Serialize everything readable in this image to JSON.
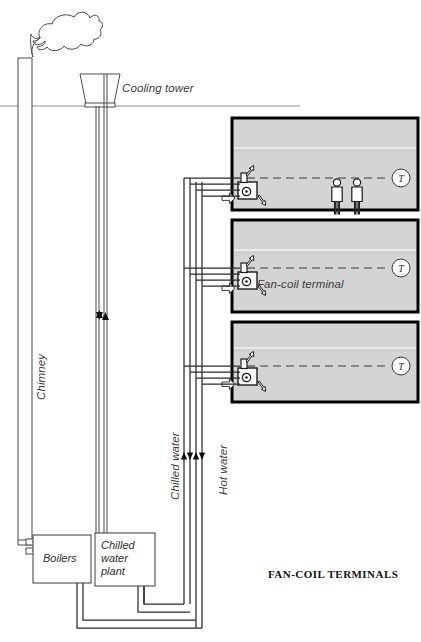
{
  "figure": {
    "title": "FAN-COIL TERMINALS",
    "title_pos": {
      "x": 268,
      "y": 568
    }
  },
  "labels": {
    "cooling_tower": "Cooling tower",
    "chimney": "Chimney",
    "chilled_water": "Chilled water",
    "hot_water": "Hot water",
    "fan_coil_terminal": "Fan-coil terminal",
    "boilers": "Boilers",
    "chilled_water_plant_line1": "Chilled",
    "chilled_water_plant_line2": "water",
    "chilled_water_plant_line3": "plant"
  },
  "thermostat": {
    "glyph": "T",
    "count": 3
  },
  "rooms": [
    {
      "index": 1,
      "x": 232,
      "y": 118,
      "w": 186,
      "h": 92,
      "occupants": 2,
      "thermostat_cx": 401,
      "thermostat_cy": 178
    },
    {
      "index": 2,
      "x": 232,
      "y": 220,
      "w": 186,
      "h": 92,
      "occupants": 0,
      "thermostat_cx": 401,
      "thermostat_cy": 268
    },
    {
      "index": 3,
      "x": 232,
      "y": 322,
      "w": 186,
      "h": 80,
      "occupants": 0,
      "thermostat_cx": 401,
      "thermostat_cy": 366
    }
  ],
  "colors": {
    "room_fill": "#d4d4d4",
    "room_border": "#000000",
    "line": "#3a3a3a",
    "pipe": "#2b2b2b",
    "ground": "#8a8a8a",
    "text": "#2e2e2e",
    "white": "#ffffff"
  },
  "plant": {
    "boilers_box": {
      "x": 33,
      "y": 535,
      "w": 58,
      "h": 48
    },
    "chiller_box": {
      "x": 95,
      "y": 533,
      "w": 60,
      "h": 53
    }
  },
  "ground_line_y": 106,
  "equipment": {
    "cooling_tower_name": "cooling-tower",
    "chimney_name": "chimney",
    "smoke_name": "smoke-plume"
  },
  "flow_arrows": {
    "up_label": "supply-flow-up",
    "down_label": "return-flow-down",
    "supply_air_label": "supply-air-arrow",
    "return_air_label": "return-air-arrow"
  }
}
